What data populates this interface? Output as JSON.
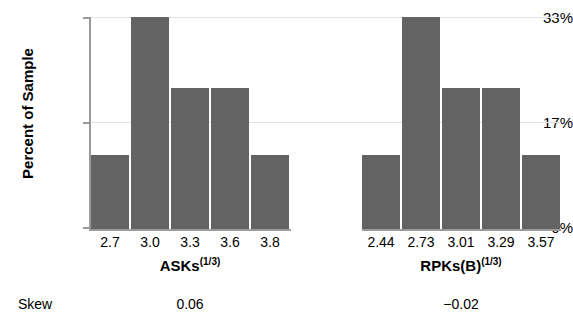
{
  "chart_data": {
    "type": "bar",
    "title": "",
    "ylabel": "Percent of Sample",
    "ylim": [
      0,
      33
    ],
    "yticks": [
      "0%",
      "17%",
      "33%"
    ],
    "ytick_values": [
      0,
      17,
      33
    ],
    "grid": true,
    "legend": null,
    "panels": [
      {
        "xlabel": "ASKs",
        "xlabel_exponent": "(1/3)",
        "categories": [
          "2.7",
          "3.0",
          "3.3",
          "3.6",
          "3.8"
        ],
        "values": [
          11.5,
          33.0,
          22.0,
          22.0,
          11.5
        ],
        "skew": "0.06"
      },
      {
        "xlabel": "RPKs(B)",
        "xlabel_exponent": "(1/3)",
        "categories": [
          "2.44",
          "2.73",
          "3.01",
          "3.29",
          "3.57"
        ],
        "values": [
          11.5,
          33.0,
          22.0,
          22.0,
          11.5
        ],
        "skew": "−0.02"
      }
    ],
    "bar_color": "#636363",
    "axis_color": "#9a9a9a",
    "grid_color": "#e2e2e2"
  },
  "footer": {
    "skew_label": "Skew"
  }
}
